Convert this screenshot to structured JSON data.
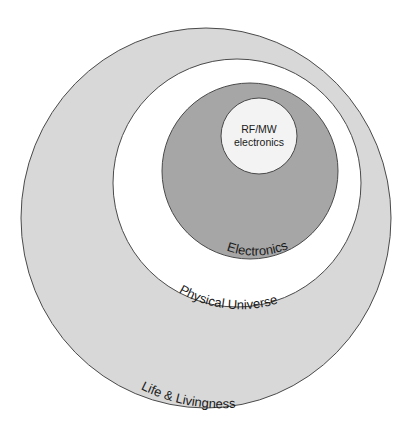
{
  "diagram": {
    "type": "nested-circles",
    "colors": {
      "outer_ring": "#d8d8d8",
      "physical": "#ffffff",
      "electronics": "#a6a6a6",
      "rf": "#f3f3f3",
      "stroke": "#4a4a4a",
      "text": "#1a1a1a"
    },
    "circles": [
      {
        "id": "life",
        "label": "Life & Livingness",
        "cx": 206,
        "cy": 218,
        "rx": 185,
        "ry": 190
      },
      {
        "id": "physical",
        "label": "Physical Universe",
        "cx": 237,
        "cy": 183,
        "r": 124
      },
      {
        "id": "electronics",
        "label": "Electronics",
        "cx": 250,
        "cy": 171,
        "r": 88
      },
      {
        "id": "rf",
        "label_line1": "RF/MW",
        "label_line2": "electronics",
        "cx": 259,
        "cy": 136,
        "r": 38
      }
    ]
  }
}
